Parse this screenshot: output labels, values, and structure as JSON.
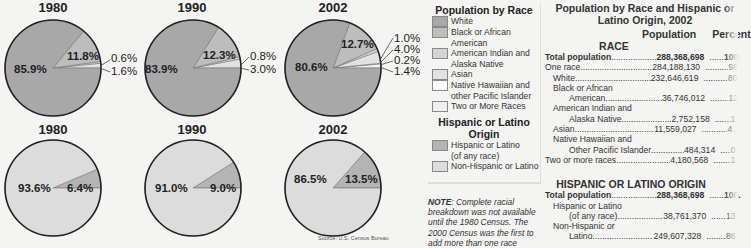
{
  "colors": {
    "white": "#a8a8a8",
    "black": "#bdbdbd",
    "american_indian": "#d4d4d4",
    "asian": "#e2e2e2",
    "native_hawaiian": "#ffffff",
    "two_or_more": "#f0f0f0",
    "hispanic": "#b4b4b4",
    "non_hispanic": "#dcdcdc"
  },
  "chart_data": [
    {
      "type": "pie",
      "title": "1980",
      "group": "Population by Race",
      "labels": [
        "White",
        "Black or African American",
        "American Indian and Alaska Native",
        "Asian"
      ],
      "values": [
        85.9,
        11.8,
        0.6,
        1.6
      ]
    },
    {
      "type": "pie",
      "title": "1990",
      "group": "Population by Race",
      "labels": [
        "White",
        "Black or African American",
        "American Indian and Alaska Native",
        "Asian"
      ],
      "values": [
        83.9,
        12.3,
        0.8,
        3.0
      ]
    },
    {
      "type": "pie",
      "title": "2002",
      "group": "Population by Race",
      "labels": [
        "White",
        "Black or African American",
        "American Indian and Alaska Native",
        "Asian",
        "Native Hawaiian and other Pacific Islander",
        "Two or More Races"
      ],
      "values": [
        80.6,
        12.7,
        1.0,
        4.0,
        0.2,
        1.4
      ]
    },
    {
      "type": "pie",
      "title": "1980",
      "group": "Hispanic or Latino Origin",
      "labels": [
        "Non-Hispanic or Latino",
        "Hispanic or Latino (of any race)"
      ],
      "values": [
        93.6,
        6.4
      ]
    },
    {
      "type": "pie",
      "title": "1990",
      "group": "Hispanic or Latino Origin",
      "labels": [
        "Non-Hispanic or Latino",
        "Hispanic or Latino (of any race)"
      ],
      "values": [
        91.0,
        9.0
      ]
    },
    {
      "type": "pie",
      "title": "2002",
      "group": "Hispanic or Latino Origin",
      "labels": [
        "Non-Hispanic or Latino",
        "Hispanic or Latino (of any race)"
      ],
      "values": [
        86.5,
        13.5
      ]
    }
  ],
  "pies": {
    "r1980": {
      "title": "1980",
      "main": "85.9%",
      "second": "11.8%",
      "outer": [
        "0.6%",
        "1.6%"
      ]
    },
    "r1990": {
      "title": "1990",
      "main": "83.9%",
      "second": "12.3%",
      "outer": [
        "0.8%",
        "3.0%"
      ]
    },
    "r2002": {
      "title": "2002",
      "main": "80.6%",
      "second": "12.7%",
      "outer": [
        "1.0%",
        "4.0%",
        "0.2%",
        "1.4%"
      ]
    },
    "h1980": {
      "title": "1980",
      "main": "93.6%",
      "second": "6.4%"
    },
    "h1990": {
      "title": "1990",
      "main": "91.0%",
      "second": "9.0%"
    },
    "h2002": {
      "title": "2002",
      "main": "86.5%",
      "second": "13.5%"
    }
  },
  "source": "Source: U.S. Census Bureau",
  "legend": {
    "race_title": "Population by Race",
    "race_items": [
      {
        "label": "White"
      },
      {
        "label": "Black or African\n   American"
      },
      {
        "label": "American Indian and\n   Alaska Native"
      },
      {
        "label": "Asian"
      },
      {
        "label": "Native Hawaiian and\n   other Pacific Islander"
      },
      {
        "label": "Two or More Races"
      }
    ],
    "hisp_title": "Hispanic or Latino Origin",
    "hisp_items": [
      {
        "label": "Hispanic or Latino\n   (of any race)"
      },
      {
        "label": "Non-Hispanic or Latino"
      }
    ]
  },
  "note": {
    "label": "NOTE",
    "text": ": Complete racial breakdown was not available until the 1980 Census.  The 2000 Census was the first to add more than one race"
  },
  "table": {
    "title": "Population by Race and Hispanic or Latino Origin, 2002",
    "col_population": "Population",
    "col_percent": "Percent",
    "race_section": "RACE",
    "race_rows": [
      {
        "name": "Total population",
        "population": "288,368,698",
        "percent": "100",
        "bold": true,
        "indent": 0
      },
      {
        "name": "One race",
        "population": "284,188,130",
        "percent": "98",
        "indent": 0
      },
      {
        "name": "White",
        "population": "232,646,619",
        "percent": "80",
        "indent": 1
      },
      {
        "name": "Black or African",
        "population": "",
        "percent": "",
        "indent": 1
      },
      {
        "name": "American",
        "population": "36,746,012",
        "percent": "12",
        "indent": 2
      },
      {
        "name": "American Indian and",
        "population": "",
        "percent": "",
        "indent": 1
      },
      {
        "name": "Alaska Native",
        "population": "2,752,158",
        "percent": "1.",
        "indent": 2
      },
      {
        "name": "Asian",
        "population": "11,559,027",
        "percent": "4.",
        "indent": 1
      },
      {
        "name": "Native Hawaiian and",
        "population": "",
        "percent": "",
        "indent": 1
      },
      {
        "name": "Other Pacific Islander",
        "population": "484,314",
        "percent": "0.",
        "indent": 2
      },
      {
        "name": "Two or more races",
        "population": "4,180,568",
        "percent": "1.",
        "indent": 0
      }
    ],
    "hisp_section": "HISPANIC OR LATINO ORIGIN",
    "hisp_rows": [
      {
        "name": "Total population",
        "population": "288,368,698",
        "percent": "100.",
        "bold": true,
        "indent": 0
      },
      {
        "name": "Hispanic or Latino",
        "population": "",
        "percent": "",
        "indent": 1
      },
      {
        "name": "(of any race)",
        "population": "38,761,370",
        "percent": "13.",
        "indent": 2
      },
      {
        "name": "Non-Hispanic or",
        "population": "",
        "percent": "",
        "indent": 1
      },
      {
        "name": "Latino",
        "population": "249,607,328",
        "percent": "86.",
        "indent": 2
      }
    ]
  }
}
